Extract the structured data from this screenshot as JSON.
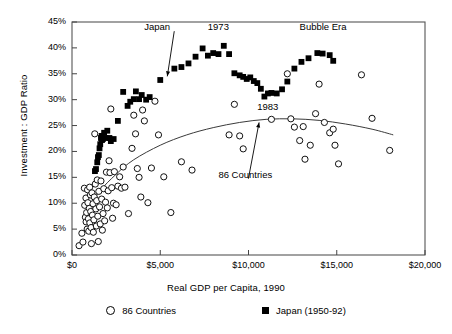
{
  "chart_data": {
    "type": "scatter",
    "title": "",
    "xlabel": "Real GDP per Capita, 1990",
    "ylabel": "Investment : GDP Ratio",
    "xlim": [
      0,
      20000
    ],
    "ylim": [
      0,
      45
    ],
    "xticks": [
      0,
      5000,
      10000,
      15000,
      20000
    ],
    "xtick_labels": [
      "$0",
      "$5,000",
      "$10,000",
      "$15,000",
      "$20,000"
    ],
    "yticks": [
      0,
      5,
      10,
      15,
      20,
      25,
      30,
      35,
      40,
      45
    ],
    "ytick_labels": [
      "0%",
      "5%",
      "10%",
      "15%",
      "20%",
      "25%",
      "30%",
      "35%",
      "40%",
      "45%"
    ],
    "grid": false,
    "frame": true,
    "legend_position": "below",
    "series": [
      {
        "name": "86 Countries",
        "marker": "open-circle",
        "color": "#000000",
        "points": [
          [
            400,
            1.8
          ],
          [
            560,
            4.2
          ],
          [
            620,
            2.5
          ],
          [
            700,
            12.9
          ],
          [
            720,
            9.6
          ],
          [
            760,
            7.3
          ],
          [
            790,
            11.0
          ],
          [
            800,
            6.4
          ],
          [
            830,
            8.2
          ],
          [
            860,
            5.0
          ],
          [
            880,
            12.6
          ],
          [
            900,
            10.1
          ],
          [
            930,
            7.0
          ],
          [
            950,
            4.6
          ],
          [
            980,
            9.0
          ],
          [
            1000,
            13.1
          ],
          [
            1010,
            6.2
          ],
          [
            1040,
            11.6
          ],
          [
            1060,
            8.4
          ],
          [
            1080,
            5.3
          ],
          [
            1100,
            2.2
          ],
          [
            1130,
            12.0
          ],
          [
            1160,
            7.7
          ],
          [
            1190,
            9.9
          ],
          [
            1210,
            4.4
          ],
          [
            1240,
            6.8
          ],
          [
            1260,
            11.2
          ],
          [
            1290,
            23.4
          ],
          [
            1320,
            13.7
          ],
          [
            1350,
            8.9
          ],
          [
            1380,
            5.6
          ],
          [
            1400,
            10.5
          ],
          [
            1430,
            14.5
          ],
          [
            1460,
            7.5
          ],
          [
            1490,
            2.6
          ],
          [
            1520,
            12.3
          ],
          [
            1560,
            9.3
          ],
          [
            1600,
            6.0
          ],
          [
            1640,
            14.3
          ],
          [
            1680,
            10.8
          ],
          [
            1720,
            4.8
          ],
          [
            1760,
            8.0
          ],
          [
            1800,
            12.8
          ],
          [
            1850,
            6.6
          ],
          [
            1900,
            10.2
          ],
          [
            1950,
            16.0
          ],
          [
            2000,
            9.1
          ],
          [
            2050,
            12.4
          ],
          [
            2100,
            18.2
          ],
          [
            2150,
            15.9
          ],
          [
            2200,
            28.2
          ],
          [
            2250,
            13.0
          ],
          [
            2300,
            7.1
          ],
          [
            2350,
            10.0
          ],
          [
            2400,
            16.1
          ],
          [
            2500,
            9.7
          ],
          [
            2600,
            13.3
          ],
          [
            2700,
            15.1
          ],
          [
            2800,
            12.9
          ],
          [
            2900,
            17.0
          ],
          [
            3000,
            13.1
          ],
          [
            3200,
            8.0
          ],
          [
            3400,
            20.6
          ],
          [
            3500,
            27.0
          ],
          [
            3600,
            23.4
          ],
          [
            3700,
            16.7
          ],
          [
            3800,
            15.0
          ],
          [
            3900,
            11.2
          ],
          [
            4000,
            28.0
          ],
          [
            4100,
            25.9
          ],
          [
            4300,
            10.1
          ],
          [
            4500,
            16.8
          ],
          [
            4700,
            29.7
          ],
          [
            4900,
            23.2
          ],
          [
            5200,
            15.1
          ],
          [
            5600,
            8.2
          ],
          [
            6200,
            18.0
          ],
          [
            6800,
            16.4
          ],
          [
            8900,
            23.2
          ],
          [
            9200,
            29.1
          ],
          [
            9500,
            23.0
          ],
          [
            9700,
            20.5
          ],
          [
            11300,
            26.2
          ],
          [
            12200,
            35.0
          ],
          [
            12400,
            26.3
          ],
          [
            12600,
            24.7
          ],
          [
            12900,
            22.1
          ],
          [
            13100,
            24.8
          ],
          [
            13200,
            18.5
          ],
          [
            13500,
            21.2
          ],
          [
            13800,
            27.3
          ],
          [
            14000,
            33.0
          ],
          [
            14300,
            25.6
          ],
          [
            14600,
            23.6
          ],
          [
            14800,
            24.3
          ],
          [
            14900,
            21.2
          ],
          [
            15100,
            17.6
          ],
          [
            16400,
            34.8
          ],
          [
            17000,
            26.4
          ],
          [
            18000,
            20.2
          ]
        ],
        "fit_curve": {
          "description": "quadratic fit through 86 countries",
          "points": [
            [
              600,
              7.0
            ],
            [
              1500,
              12.0
            ],
            [
              2500,
              15.6
            ],
            [
              3500,
              18.4
            ],
            [
              5000,
              21.2
            ],
            [
              6500,
              23.2
            ],
            [
              8000,
              24.6
            ],
            [
              9500,
              25.6
            ],
            [
              11000,
              26.2
            ],
            [
              12500,
              26.3
            ],
            [
              14000,
              26.0
            ],
            [
              15500,
              25.3
            ],
            [
              17000,
              24.3
            ],
            [
              18200,
              23.2
            ]
          ]
        }
      },
      {
        "name": "Japan (1950-92)",
        "marker": "filled-square",
        "color": "#000000",
        "points": [
          [
            1300,
            16.2
          ],
          [
            1360,
            16.6
          ],
          [
            1430,
            17.9
          ],
          [
            1470,
            18.9
          ],
          [
            1520,
            19.3
          ],
          [
            1560,
            20.6
          ],
          [
            1600,
            21.4
          ],
          [
            1640,
            22.6
          ],
          [
            1680,
            23.0
          ],
          [
            1700,
            22.2
          ],
          [
            1750,
            22.4
          ],
          [
            1820,
            23.6
          ],
          [
            1900,
            22.6
          ],
          [
            2000,
            24.0
          ],
          [
            2120,
            22.6
          ],
          [
            2200,
            22.0
          ],
          [
            2360,
            22.4
          ],
          [
            2600,
            25.9
          ],
          [
            2900,
            31.5
          ],
          [
            3150,
            28.8
          ],
          [
            3300,
            29.6
          ],
          [
            3500,
            30.1
          ],
          [
            3620,
            31.6
          ],
          [
            3800,
            30.1
          ],
          [
            3950,
            30.9
          ],
          [
            4200,
            30.0
          ],
          [
            4400,
            30.5
          ],
          [
            5000,
            33.8
          ],
          [
            5800,
            36.0
          ],
          [
            6200,
            36.3
          ],
          [
            6600,
            37.0
          ],
          [
            7000,
            38.3
          ],
          [
            7400,
            39.9
          ],
          [
            7700,
            38.5
          ],
          [
            8000,
            39.0
          ],
          [
            8300,
            38.8
          ],
          [
            8600,
            40.4
          ],
          [
            8900,
            38.8
          ],
          [
            9200,
            35.1
          ],
          [
            9500,
            34.7
          ],
          [
            9700,
            34.4
          ],
          [
            9900,
            34.0
          ],
          [
            10100,
            34.3
          ],
          [
            10300,
            33.6
          ],
          [
            10500,
            33.2
          ],
          [
            10700,
            32.1
          ],
          [
            10900,
            30.6
          ],
          [
            11100,
            31.2
          ],
          [
            11300,
            31.3
          ],
          [
            11600,
            31.2
          ],
          [
            11900,
            32.0
          ],
          [
            12200,
            33.5
          ],
          [
            12600,
            36.0
          ],
          [
            13000,
            37.3
          ],
          [
            13400,
            38.0
          ],
          [
            13900,
            39.0
          ],
          [
            14200,
            38.9
          ],
          [
            14600,
            38.6
          ],
          [
            14800,
            37.5
          ]
        ]
      }
    ],
    "annotations": [
      {
        "text": "Japan",
        "x": 5000,
        "y": 44.0,
        "arrow_to": {
          "x": 5400,
          "y": 34.5
        }
      },
      {
        "text": "1973",
        "x": 8600,
        "y": 44.0,
        "arrow_to": null
      },
      {
        "text": "Bubble Era",
        "x": 13800,
        "y": 44.0,
        "arrow_to": null
      },
      {
        "text": "1983",
        "x": 11400,
        "y": 28.5,
        "arrow_to": null
      },
      {
        "text": "86 Countries",
        "x": 9200,
        "y": 15.5,
        "arrow_to": {
          "x": 10600,
          "y": 25.6
        }
      }
    ]
  },
  "legend": {
    "items": [
      {
        "label": "86 Countries",
        "marker": "open-circle"
      },
      {
        "label": "Japan (1950-92)",
        "marker": "filled-square"
      }
    ]
  }
}
